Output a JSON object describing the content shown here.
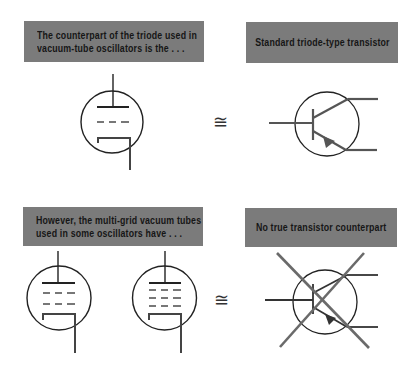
{
  "panels": [
    {
      "id": "triode",
      "caption_lines": [
        "The counterpart of the triode used in",
        "vacuum-tube oscillators is the . . ."
      ],
      "symbol": "triode-vacuum-tube"
    },
    {
      "id": "transistor",
      "caption_lines": [
        "Standard triode-type transistor"
      ],
      "symbol": "npn-transistor"
    },
    {
      "id": "multigrid",
      "caption_lines": [
        "However, the multi-grid vacuum tubes",
        "used in some oscillators have . . ."
      ],
      "symbol": "tetrode-and-pentode-vacuum-tubes"
    },
    {
      "id": "none",
      "caption_lines": [
        "No true transistor counterpart"
      ],
      "symbol": "crossed-out-transistor"
    }
  ],
  "relations": [
    "≅",
    "≅"
  ],
  "colors": {
    "caption_bg": "#7b7b7b",
    "caption_text": "#161616",
    "tube_line": "#222222",
    "transistor_line": "#555555",
    "cross_line": "#6a6a6a"
  }
}
